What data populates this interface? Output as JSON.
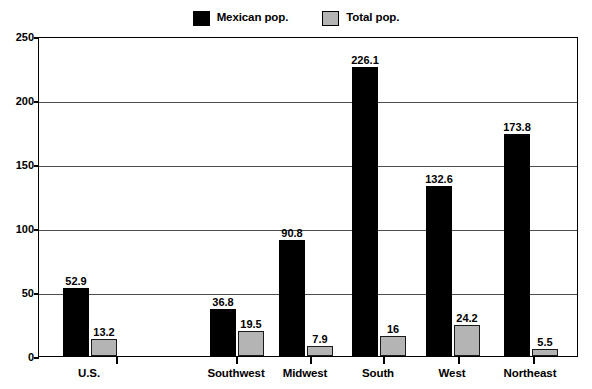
{
  "chart_data": {
    "type": "bar",
    "title": "",
    "subtitle": "",
    "xlabel": "",
    "ylabel": "",
    "ylim": [
      0,
      250
    ],
    "yticks": [
      "0",
      "50",
      "100",
      "150",
      "200",
      "250"
    ],
    "grid": true,
    "legend_position": "top-center",
    "categories": [
      "U.S.",
      "Southwest",
      "Midwest",
      "South",
      "West",
      "Northeast"
    ],
    "series": [
      {
        "name": "Mexican pop.",
        "color": "#000000",
        "values": [
          52.9,
          36.8,
          90.8,
          226.1,
          132.6,
          173.8
        ],
        "labels": [
          "52.9",
          "36.8",
          "90.8",
          "226.1",
          "132.6",
          "173.8"
        ]
      },
      {
        "name": "Total pop.",
        "color": "#b4b4b4",
        "values": [
          13.2,
          19.5,
          7.9,
          16,
          24.2,
          5.5
        ],
        "labels": [
          "13.2",
          "19.5",
          "7.9",
          "16",
          "24.2",
          "5.5"
        ]
      }
    ]
  },
  "legend": {
    "entries": [
      {
        "label": "Mexican pop.",
        "swatch": "black"
      },
      {
        "label": "Total pop.",
        "swatch": "gray"
      }
    ]
  },
  "axes": {
    "y": {
      "ticks": [
        "250",
        "200",
        "150",
        "100",
        "50",
        "0"
      ]
    },
    "x": {
      "categories": [
        "U.S.",
        "Southwest",
        "Midwest",
        "South",
        "West",
        "Northeast"
      ]
    }
  }
}
